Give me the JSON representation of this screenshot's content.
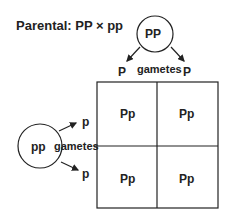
{
  "title": "Parental: PP × pp",
  "parent_top": {
    "genotype": "PP",
    "gametes_label": "gametes",
    "gametes": [
      "P",
      "P"
    ]
  },
  "parent_left": {
    "genotype": "pp",
    "gametes_label": "gametes",
    "gametes": [
      "p",
      "p"
    ]
  },
  "punnett": {
    "cells": [
      [
        "Pp",
        "Pp"
      ],
      [
        "Pp",
        "Pp"
      ]
    ]
  },
  "colors": {
    "ink": "#222222",
    "background": "#ffffff"
  }
}
